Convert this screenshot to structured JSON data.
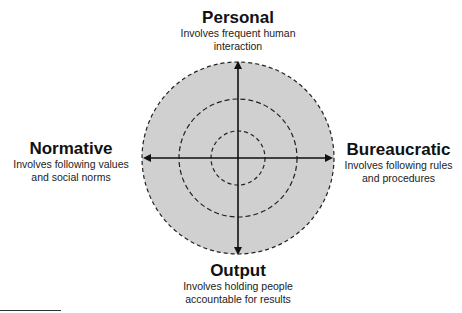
{
  "diagram": {
    "type": "polar-axis-diagram",
    "fill_color": "#d0d0d0",
    "stroke_color": "#222222",
    "circles": [
      "outer",
      "middle",
      "inner"
    ],
    "axes": {
      "top": {
        "title": "Personal",
        "description_line1": "Involves frequent human",
        "description_line2": "interaction"
      },
      "left": {
        "title": "Normative",
        "description_line1": "Involves following values",
        "description_line2": "and social norms"
      },
      "right": {
        "title": "Bureaucratic",
        "description_line1": "Involves following rules",
        "description_line2": "and procedures"
      },
      "bottom": {
        "title": "Output",
        "description_line1": "Involves holding people",
        "description_line2": "accountable for results"
      }
    }
  }
}
